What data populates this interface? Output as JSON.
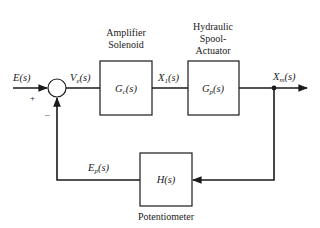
{
  "diagram": {
    "type": "block-diagram",
    "signals": {
      "input": {
        "name": "E",
        "suffix": "(s)"
      },
      "error": {
        "name": "V",
        "sub": "e",
        "suffix": "(s)"
      },
      "intermediate": {
        "name": "X",
        "sub": "1",
        "suffix": "(s)"
      },
      "output": {
        "name": "X",
        "sub": "m",
        "suffix": "(s)"
      },
      "feedback": {
        "name": "E",
        "sub": "p",
        "suffix": "(s)"
      }
    },
    "summing_junction": {
      "plus_sign": "+",
      "minus_sign": "–"
    },
    "blocks": [
      {
        "id": "amplifier",
        "caption_lines": [
          "Amplifier",
          "Solenoid"
        ],
        "tf_name": "G",
        "tf_sub": "c",
        "tf_suffix": "(s)"
      },
      {
        "id": "spool",
        "caption_lines": [
          "Hydraulic",
          "Spool-",
          "Actuator"
        ],
        "tf_name": "G",
        "tf_sub": "p",
        "tf_suffix": "(s)"
      },
      {
        "id": "potentiometer",
        "caption_lines": [
          "Potentiometer"
        ],
        "tf_name": "H",
        "tf_sub": "",
        "tf_suffix": "(s)"
      }
    ],
    "colors": {
      "stroke": "#1a1a1a",
      "background": "#ffffff"
    }
  }
}
